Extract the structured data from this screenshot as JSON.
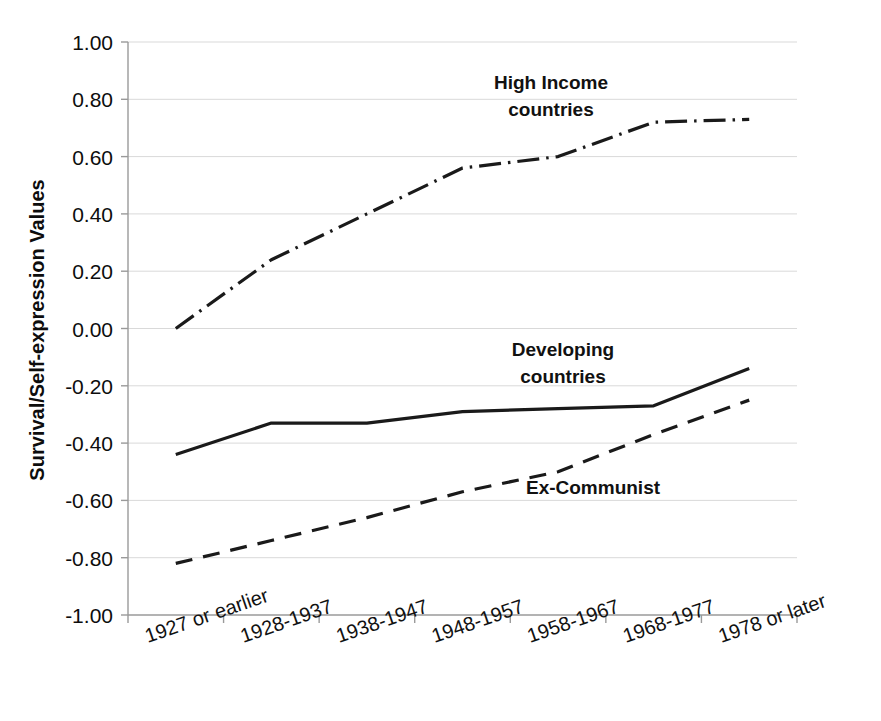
{
  "chart_data": {
    "type": "line",
    "title": "",
    "xlabel": "",
    "ylabel": "Survival/Self-expression Values",
    "ylim": [
      -1.0,
      1.0
    ],
    "ytick_labels": [
      "1.00",
      "0.80",
      "0.60",
      "0.40",
      "0.20",
      "0.00",
      "-0.20",
      "-0.40",
      "-0.60",
      "-0.80",
      "-1.00"
    ],
    "ytick_values": [
      1.0,
      0.8,
      0.6,
      0.4,
      0.2,
      0.0,
      -0.2,
      -0.4,
      -0.6,
      -0.8,
      -1.0
    ],
    "grid": true,
    "legend_position": "inline-annotations",
    "categories": [
      "1927 or earlier",
      "1928-1937",
      "1938-1947",
      "1948-1957",
      "1958-1967",
      "1968-1977",
      "1978 or later"
    ],
    "series": [
      {
        "name": "High Income countries",
        "label": "High Income\ncountries",
        "label_line1": "High Income",
        "label_line2": "countries",
        "style": "dash-dot",
        "color": "#1a1a1a",
        "values": [
          0.0,
          0.24,
          0.4,
          0.56,
          0.6,
          0.72,
          0.73
        ]
      },
      {
        "name": "Developing countries",
        "label": "Developing\ncountries",
        "label_line1": "Developing",
        "label_line2": "countries",
        "style": "solid",
        "color": "#1a1a1a",
        "values": [
          -0.44,
          -0.33,
          -0.33,
          -0.29,
          -0.28,
          -0.27,
          -0.14
        ]
      },
      {
        "name": "Ex-Communist",
        "label": "Ex-Communist",
        "label_line1": "Ex-Communist",
        "label_line2": "",
        "style": "dashed",
        "color": "#1a1a1a",
        "values": [
          -0.82,
          -0.74,
          -0.66,
          -0.57,
          -0.5,
          -0.37,
          -0.25
        ]
      }
    ]
  },
  "colors": {
    "line": "#1a1a1a",
    "grid": "#d9d9d9",
    "axis": "#9a9a9a",
    "text": "#111111",
    "background": "#ffffff"
  }
}
